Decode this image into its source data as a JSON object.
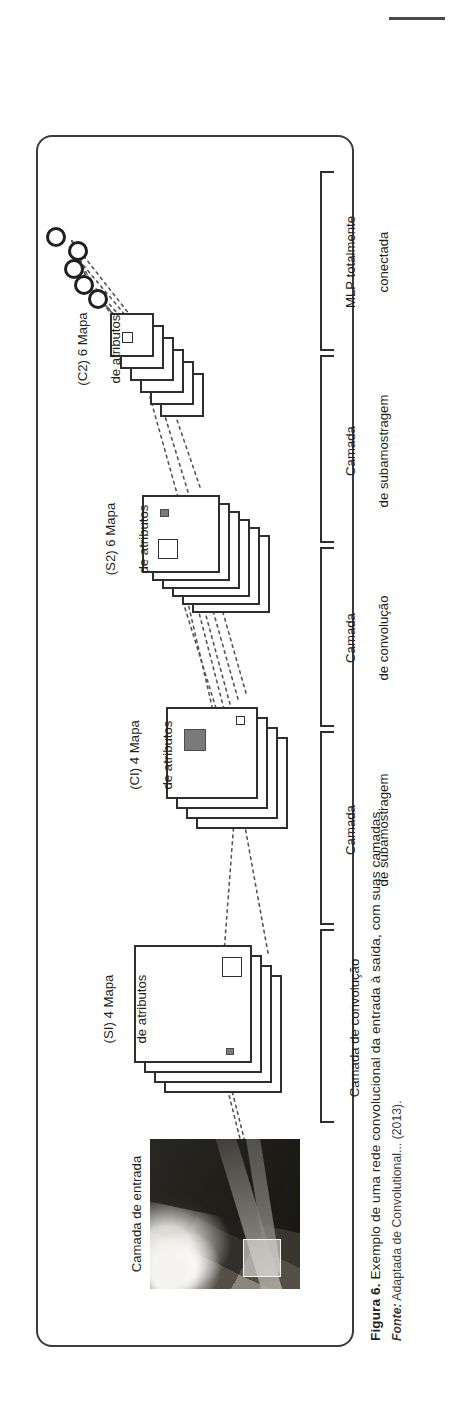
{
  "page": {
    "top_rule": "horizontal-rule"
  },
  "figure": {
    "caption_prefix": "Figura 6.",
    "caption_text": " Exemplo de uma rede convolucional da entrada à saída, com suas camadas.",
    "source_prefix": "Fonte:",
    "source_text": " Adaptada de Convolutional... (2013)."
  },
  "diagram": {
    "layer_labels": [
      {
        "id": "input",
        "line1": "Camada de entrada",
        "line2": ""
      },
      {
        "id": "s1",
        "line1": "(SI) 4 Mapa",
        "line2": "de atributos"
      },
      {
        "id": "c1",
        "line1": "(CI) 4 Mapa",
        "line2": "de atributos"
      },
      {
        "id": "s2",
        "line1": "(S2) 6 Mapa",
        "line2": "de atributos"
      },
      {
        "id": "c2",
        "line1": "(C2) 6 Mapa",
        "line2": "de atributos"
      }
    ],
    "bracket_labels": [
      {
        "id": "conv1",
        "line1": "Camada de convolução",
        "line2": ""
      },
      {
        "id": "sub1",
        "line1": "Camada",
        "line2": "de subamostragem"
      },
      {
        "id": "conv2",
        "line1": "Camada",
        "line2": "de convolução"
      },
      {
        "id": "sub2",
        "line1": "Camada",
        "line2": "de subamostragem"
      },
      {
        "id": "mlp",
        "line1": "MLP totalmente",
        "line2": "conectada"
      }
    ],
    "neuron_count": 5,
    "s1_maps": 4,
    "c1_maps": 4,
    "s2_maps": 6,
    "c2_maps": 6,
    "colors": {
      "stroke": "#2e2e2e",
      "text": "#231f20",
      "filled_patch": "#7a7a7a",
      "frame": "#3b3b3b"
    }
  }
}
